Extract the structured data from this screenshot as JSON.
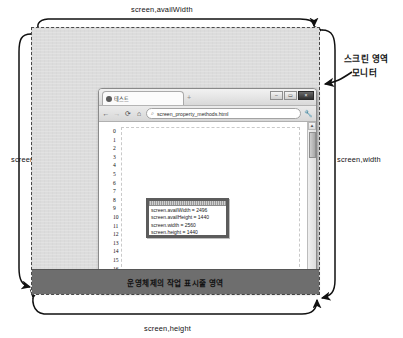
{
  "diagram": {
    "labels": {
      "avail_width": "screen,availWidth",
      "avail_height": "screen,availHeight",
      "width": "screen,width",
      "height": "screen,height"
    },
    "callout": {
      "line1": "스크린 영역",
      "line2": "모니터"
    },
    "taskbar_label": "운영체제의 작업 표시줄 영역",
    "colors": {
      "screen_bg": "#dcdcdc",
      "taskbar_bg": "#6e6e6e",
      "dashed_border": "#4a4a4a",
      "arrow": "#111111"
    }
  },
  "browser": {
    "tab": {
      "title": "테스트",
      "close_glyph": "×",
      "new_tab_glyph": "+"
    },
    "window_buttons": [
      {
        "name": "minimize",
        "glyph": "–"
      },
      {
        "name": "maximize",
        "glyph": "▭"
      },
      {
        "name": "close",
        "glyph": "×"
      }
    ],
    "toolbar": {
      "back_glyph": "←",
      "forward_glyph": "→",
      "reload_glyph": "⟳",
      "home_glyph": "⌂",
      "search_glyph": "⌕",
      "url": "screen_property_methods.html",
      "menu_glyph": "🔧"
    },
    "gutter_numbers": [
      "0",
      "1",
      "2",
      "3",
      "4",
      "5",
      "6",
      "7",
      "8",
      "9",
      "10",
      "11",
      "12",
      "13",
      "14",
      "15",
      "16"
    ],
    "scrollbars": {
      "up_glyph": "▲",
      "down_glyph": "▼",
      "left_glyph": "◀",
      "right_glyph": "▶"
    }
  },
  "alert_dialog": {
    "lines": [
      "screen.availWidth = 2496",
      "screen.availHeight = 1440",
      "screen.width = 2560",
      "screen.height = 1440"
    ]
  }
}
